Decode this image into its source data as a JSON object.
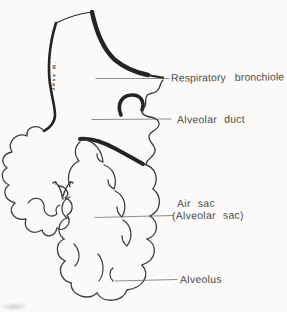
{
  "figure": {
    "signature": "Jose M.",
    "labels": {
      "respiratory_bronchiole": "Respiratory bronchiole",
      "alveolar_duct": "Alveolar duct",
      "air_sac": "Air sac",
      "air_sac_paren": "(Alveolar sac)",
      "alveolus": "Alveolus"
    },
    "colors": {
      "background": "#fbfaf8",
      "ink": "#242424",
      "thin_ink": "#3f3f3f",
      "leader_line": "#8e8e8e",
      "label_text": "#4c4c4c"
    }
  }
}
